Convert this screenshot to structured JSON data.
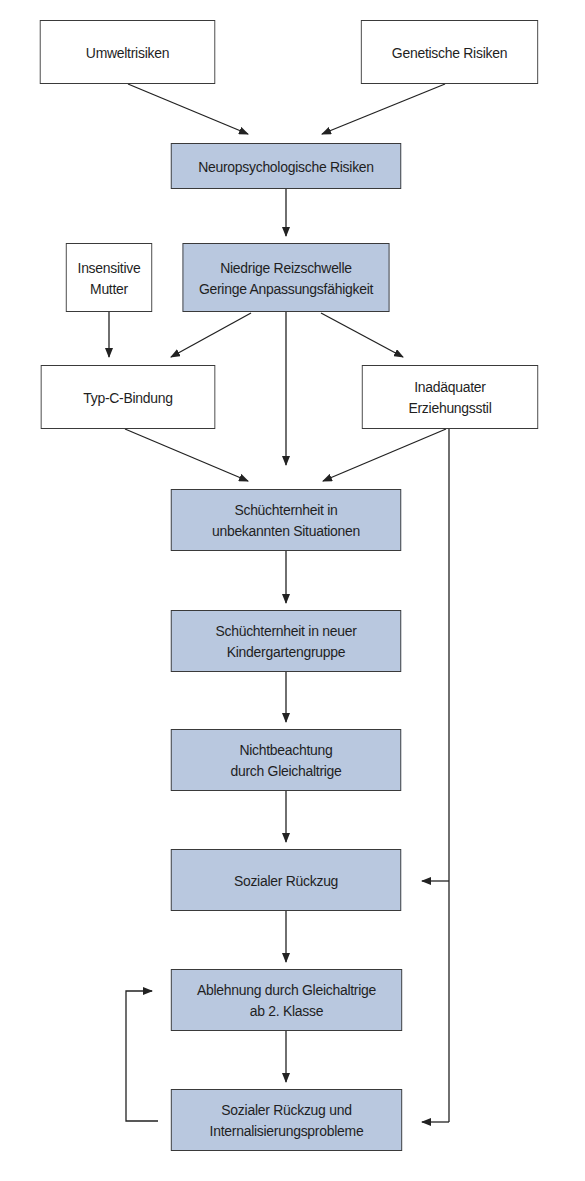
{
  "diagram": {
    "colors": {
      "box_fill": "#b9c8df",
      "box_border": "#3a3a3a",
      "line": "#222222",
      "white": "#ffffff"
    },
    "nodes": [
      {
        "id": "umwelt",
        "label": "Umweltrisiken",
        "style": "white"
      },
      {
        "id": "genetisch",
        "label": "Genetische Risiken",
        "style": "white"
      },
      {
        "id": "neuro",
        "label": "Neuropsychologische Risiken",
        "style": "blue"
      },
      {
        "id": "insensitiv",
        "label": "Insensitive\nMutter",
        "style": "white"
      },
      {
        "id": "reizschwelle",
        "label": "Niedrige Reizschwelle\nGeringe Anpassungsfähigkeit",
        "style": "blue"
      },
      {
        "id": "typc",
        "label": "Typ-C-Bindung",
        "style": "white"
      },
      {
        "id": "erziehung",
        "label": "Inadäquater\nErziehungsstil",
        "style": "white"
      },
      {
        "id": "schuechtern1",
        "label": "Schüchternheit in\nunbekannten Situationen",
        "style": "blue"
      },
      {
        "id": "schuechtern2",
        "label": "Schüchternheit in neuer\nKindergartengruppe",
        "style": "blue"
      },
      {
        "id": "nichtbeachtung",
        "label": "Nichtbeachtung\ndurch Gleichaltrige",
        "style": "blue"
      },
      {
        "id": "rueckzug",
        "label": "Sozialer Rückzug",
        "style": "blue"
      },
      {
        "id": "ablehnung",
        "label": "Ablehnung durch Gleichaltrige\nab 2. Klasse",
        "style": "blue"
      },
      {
        "id": "internalisierung",
        "label": "Sozialer Rückzug und\nInternalisierungsprobleme",
        "style": "blue"
      }
    ],
    "edges": [
      {
        "from": "umwelt",
        "to": "neuro"
      },
      {
        "from": "genetisch",
        "to": "neuro"
      },
      {
        "from": "neuro",
        "to": "reizschwelle"
      },
      {
        "from": "insensitiv",
        "to": "typc"
      },
      {
        "from": "reizschwelle",
        "to": "typc"
      },
      {
        "from": "reizschwelle",
        "to": "erziehung"
      },
      {
        "from": "reizschwelle",
        "to": "schuechtern1"
      },
      {
        "from": "typc",
        "to": "schuechtern1"
      },
      {
        "from": "erziehung",
        "to": "schuechtern1"
      },
      {
        "from": "erziehung",
        "to": "rueckzug"
      },
      {
        "from": "erziehung",
        "to": "internalisierung"
      },
      {
        "from": "schuechtern1",
        "to": "schuechtern2"
      },
      {
        "from": "schuechtern2",
        "to": "nichtbeachtung"
      },
      {
        "from": "nichtbeachtung",
        "to": "rueckzug"
      },
      {
        "from": "rueckzug",
        "to": "ablehnung"
      },
      {
        "from": "ablehnung",
        "to": "internalisierung"
      },
      {
        "from": "internalisierung",
        "to": "ablehnung"
      }
    ]
  }
}
